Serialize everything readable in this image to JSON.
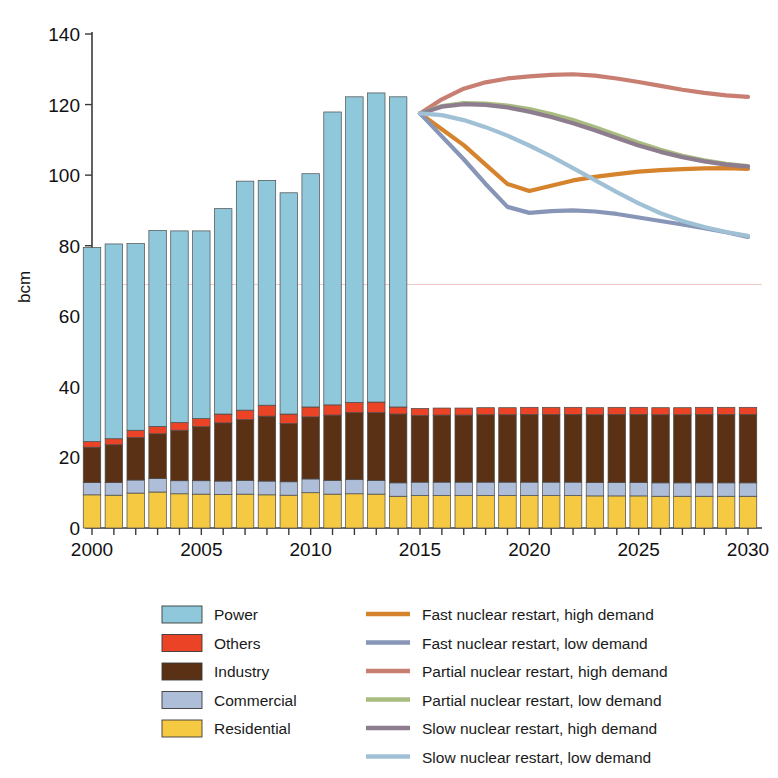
{
  "axes": {
    "ylabel": "bcm",
    "y_ticks": [
      0,
      20,
      40,
      60,
      80,
      100,
      120,
      140
    ],
    "x_ticks": [
      2000,
      2005,
      2010,
      2015,
      2020,
      2025,
      2030
    ],
    "ylim": [
      0,
      140
    ],
    "xlim": [
      1999.5,
      2030.5
    ],
    "grid": false
  },
  "legend": {
    "position": "bottom",
    "stack_entries": [
      {
        "label": "Power",
        "color": "#8FC8DA"
      },
      {
        "label": "Others",
        "color": "#EB4326"
      },
      {
        "label": "Industry",
        "color": "#5B3115"
      },
      {
        "label": "Commercial",
        "color": "#AEBDD8"
      },
      {
        "label": "Residential",
        "color": "#F6C943"
      }
    ],
    "line_entries": [
      {
        "label": "Fast nuclear restart, high demand",
        "color": "#D5832C"
      },
      {
        "label": "Fast nuclear restart, low  demand",
        "color": "#8795B6"
      },
      {
        "label": "Partial nuclear restart, high demand",
        "color": "#C87F72"
      },
      {
        "label": "Partial nuclear restart, low demand",
        "color": "#A9BC80"
      },
      {
        "label": "Slow nuclear restart, high demand",
        "color": "#8D7D8E"
      },
      {
        "label": "Slow nuclear restart, low demand",
        "color": "#A0C1D5"
      }
    ]
  },
  "chart_data": {
    "type": "bar",
    "title": "",
    "subtitle": "",
    "xlabel": "",
    "ylabel": "bcm",
    "ylim": [
      0,
      140
    ],
    "xlim": [
      1999.5,
      2030.5
    ],
    "grid": false,
    "legend_position": "bottom",
    "stacking": "stacked",
    "categories": [
      2000,
      2001,
      2002,
      2003,
      2004,
      2005,
      2006,
      2007,
      2008,
      2009,
      2010,
      2011,
      2012,
      2013,
      2014,
      2015,
      2016,
      2017,
      2018,
      2019,
      2020,
      2021,
      2022,
      2023,
      2024,
      2025,
      2026,
      2027,
      2028,
      2029,
      2030
    ],
    "series": [
      {
        "name": "Residential",
        "color": "#F6C943",
        "values": [
          9.4,
          9.3,
          9.9,
          10.2,
          9.7,
          9.6,
          9.5,
          9.6,
          9.4,
          9.3,
          10.0,
          9.6,
          9.7,
          9.6,
          9.0,
          9.2,
          9.2,
          9.2,
          9.2,
          9.2,
          9.2,
          9.2,
          9.2,
          9.1,
          9.1,
          9.1,
          9.0,
          9.0,
          9.0,
          9.0,
          9.0
        ]
      },
      {
        "name": "Commercial",
        "color": "#AEBDD8",
        "values": [
          3.5,
          3.6,
          3.7,
          3.8,
          3.7,
          3.8,
          3.8,
          3.9,
          3.9,
          3.8,
          3.9,
          3.9,
          4.0,
          3.9,
          3.8,
          3.8,
          3.8,
          3.8,
          3.8,
          3.8,
          3.8,
          3.8,
          3.8,
          3.8,
          3.8,
          3.8,
          3.8,
          3.8,
          3.8,
          3.8,
          3.8
        ]
      },
      {
        "name": "Industry",
        "color": "#5B3115",
        "values": [
          10.0,
          10.7,
          12.0,
          12.7,
          14.3,
          15.3,
          16.5,
          17.2,
          18.4,
          16.5,
          17.6,
          18.5,
          19.0,
          19.2,
          19.5,
          18.9,
          19.0,
          19.0,
          19.1,
          19.1,
          19.2,
          19.2,
          19.2,
          19.2,
          19.3,
          19.3,
          19.3,
          19.3,
          19.4,
          19.4,
          19.4
        ]
      },
      {
        "name": "Others",
        "color": "#EB4326",
        "values": [
          1.6,
          1.7,
          2.1,
          2.1,
          2.2,
          2.3,
          2.5,
          2.7,
          3.1,
          2.7,
          2.8,
          2.9,
          2.9,
          3.0,
          2.0,
          2.0,
          2.0,
          2.0,
          2.0,
          2.0,
          2.0,
          2.0,
          2.0,
          2.0,
          2.0,
          2.0,
          2.0,
          2.0,
          2.0,
          2.0,
          2.0
        ]
      },
      {
        "name": "Power",
        "color": "#8FC8DA",
        "values": [
          55.0,
          55.2,
          52.9,
          55.5,
          54.3,
          53.2,
          58.2,
          64.9,
          63.7,
          62.7,
          66.1,
          83.0,
          86.6,
          87.6,
          87.9,
          0,
          0,
          0,
          0,
          0,
          0,
          0,
          0,
          0,
          0,
          0,
          0,
          0,
          0,
          0,
          0
        ]
      }
    ],
    "stack_totals": [
      79.5,
      80.5,
      84.7,
      84.3,
      83.9,
      90.7,
      98.1,
      97.6,
      95.1,
      100.4,
      118.0,
      122.6,
      123.6,
      123.6,
      123.6
    ],
    "note_on_bars": "Bars from 2000-2014 include Power; bars from 2015-2030 show only Residential, Commercial, Industry, Others (total approx 34)",
    "projection_lines": [
      {
        "name": "Fast nuclear restart, high demand",
        "color": "#D5832C",
        "x": [
          2015,
          2016,
          2017,
          2018,
          2019,
          2020,
          2021,
          2022,
          2023,
          2024,
          2025,
          2026,
          2027,
          2028,
          2029,
          2030
        ],
        "y": [
          117.5,
          113.0,
          108.5,
          103.0,
          97.5,
          95.5,
          97.0,
          98.5,
          99.5,
          100.3,
          101.0,
          101.4,
          101.7,
          101.9,
          102.0,
          101.8
        ]
      },
      {
        "name": "Fast nuclear restart, low  demand",
        "color": "#8795B6",
        "x": [
          2015,
          2016,
          2017,
          2018,
          2019,
          2020,
          2021,
          2022,
          2023,
          2024,
          2025,
          2026,
          2027,
          2028,
          2029,
          2030
        ],
        "y": [
          117.5,
          111.0,
          104.5,
          97.5,
          91.0,
          89.3,
          89.8,
          90.0,
          89.7,
          89.0,
          88.0,
          87.0,
          86.0,
          85.0,
          83.8,
          82.5
        ]
      },
      {
        "name": "Partial nuclear restart, high demand",
        "color": "#C87F72",
        "x": [
          2015,
          2016,
          2017,
          2018,
          2019,
          2020,
          2021,
          2022,
          2023,
          2024,
          2025,
          2026,
          2027,
          2028,
          2029,
          2030
        ],
        "y": [
          117.5,
          121.5,
          124.5,
          126.3,
          127.4,
          128.0,
          128.4,
          128.6,
          128.2,
          127.4,
          126.4,
          125.3,
          124.2,
          123.3,
          122.6,
          122.2
        ]
      },
      {
        "name": "Partial nuclear restart, low demand",
        "color": "#A9BC80",
        "x": [
          2015,
          2016,
          2017,
          2018,
          2019,
          2020,
          2021,
          2022,
          2023,
          2024,
          2025,
          2026,
          2027,
          2028,
          2029,
          2030
        ],
        "y": [
          117.5,
          119.6,
          120.4,
          120.3,
          119.7,
          118.7,
          117.3,
          115.6,
          113.6,
          111.4,
          109.2,
          107.2,
          105.5,
          104.2,
          103.2,
          102.6
        ]
      },
      {
        "name": "Slow nuclear restart, high demand",
        "color": "#8D7D8E",
        "x": [
          2015,
          2016,
          2017,
          2018,
          2019,
          2020,
          2021,
          2022,
          2023,
          2024,
          2025,
          2026,
          2027,
          2028,
          2029,
          2030
        ],
        "y": [
          117.5,
          119.4,
          120.1,
          119.9,
          119.2,
          118.0,
          116.5,
          114.7,
          112.7,
          110.5,
          108.4,
          106.6,
          105.1,
          103.9,
          103.0,
          102.4
        ]
      },
      {
        "name": "Slow nuclear restart, low demand",
        "color": "#A0C1D5",
        "x": [
          2015,
          2016,
          2017,
          2018,
          2019,
          2020,
          2021,
          2022,
          2023,
          2024,
          2025,
          2026,
          2027,
          2028,
          2029,
          2030
        ],
        "y": [
          117.5,
          117.0,
          115.6,
          113.6,
          111.2,
          108.4,
          105.3,
          102.0,
          98.6,
          95.2,
          92.0,
          89.2,
          87.0,
          85.3,
          83.9,
          82.8
        ]
      }
    ]
  }
}
